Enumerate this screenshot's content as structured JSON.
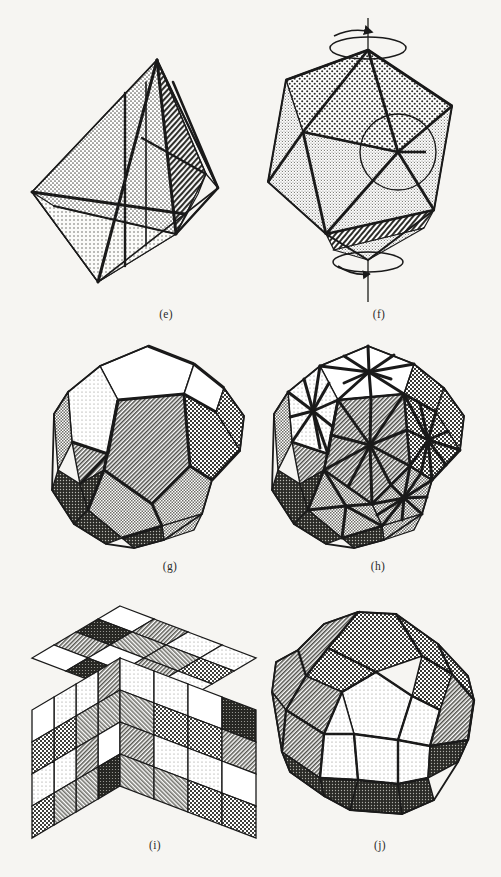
{
  "figure": {
    "background_color": "#f6f5f2",
    "ink_color": "#1a1a1a",
    "page_width": 501,
    "page_height": 877
  },
  "palette": {
    "white": "#ffffff",
    "stipple_light": "#e2e2de",
    "stipple_mid": "#cfcfca",
    "hatch_mid": "#b4b4ae",
    "checker_dark": "#8a8a84",
    "hatch_dark": "#6b6b66",
    "solid_dark": "#3a3a36",
    "outline": "#1a1a1a"
  },
  "panels": [
    {
      "id": "e",
      "caption": "(e)",
      "caption_x": 166,
      "caption_y": 316,
      "shape_name": "tetrahedron",
      "title": "Tetrahedron with bisecting mirror planes",
      "features": [
        "stippled front faces",
        "dark hatched right face",
        "heavy internal plane edges"
      ]
    },
    {
      "id": "f",
      "caption": "(f)",
      "caption_x": 379,
      "caption_y": 316,
      "shape_name": "icosahedron",
      "title": "Icosahedron with fivefold rotation axis",
      "features": [
        "vertical rotation axis line",
        "curved rotation arrow at top vertex",
        "curved rotation arrow at bottom vertex",
        "circle highlighting a fivefold vertex",
        "stippled upper faces",
        "hatched bottom-right face"
      ]
    },
    {
      "id": "g",
      "caption": "(g)",
      "caption_x": 170,
      "caption_y": 568,
      "shape_name": "dodecahedron",
      "title": "Dodecahedron with patterned pentagonal faces",
      "features": [
        "white top faces",
        "diagonally hatched front faces",
        "checkered right faces",
        "dark lower-left faces"
      ]
    },
    {
      "id": "h",
      "caption": "(h)",
      "caption_x": 378,
      "caption_y": 568,
      "shape_name": "dodecahedron-subdivided",
      "title": "Dodecahedron with fivefold star subdivision of each face",
      "features": [
        "radial spokes from each face centre",
        "white top face",
        "hatched front faces",
        "checkered right faces"
      ]
    },
    {
      "id": "i",
      "caption": "(i)",
      "caption_x": 155,
      "caption_y": 847,
      "shape_name": "cube-4x4x4",
      "title": "Four-by-four-by-four cube of patterned unit cells",
      "features": [
        "16 visible cells per face",
        "assorted stipple, hatch, checker and solid fills"
      ]
    },
    {
      "id": "j",
      "caption": "(j)",
      "caption_x": 380,
      "caption_y": 847,
      "shape_name": "rhombicuboctahedron",
      "title": "Rhombicuboctahedron with square and triangular faces",
      "features": [
        "light stippled front faces",
        "checkered upper faces",
        "hatched left faces",
        "dark bottom faces"
      ]
    }
  ]
}
